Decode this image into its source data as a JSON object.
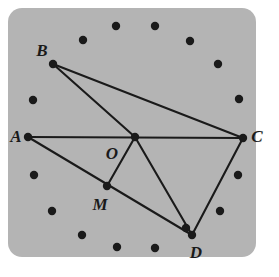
{
  "figure": {
    "kind": "geometry-diagram",
    "background_color": "#b4b4b4",
    "page_color": "#ffffff",
    "stroke_color": "#1a1a1a",
    "board": {
      "x": 8,
      "y": 8,
      "width": 248,
      "height": 249,
      "corner_radius": 14
    },
    "vertices": [
      {
        "id": "A",
        "label": "A",
        "x": 28,
        "y": 137,
        "label_x": 16,
        "label_y": 136
      },
      {
        "id": "B",
        "label": "B",
        "x": 53,
        "y": 64,
        "label_x": 42,
        "label_y": 50
      },
      {
        "id": "C",
        "label": "C",
        "x": 243,
        "y": 138,
        "label_x": 257,
        "label_y": 136
      },
      {
        "id": "D",
        "label": "D",
        "x": 192,
        "y": 235,
        "label_x": 196,
        "label_y": 252
      },
      {
        "id": "M",
        "label": "M",
        "x": 107,
        "y": 186,
        "label_x": 100,
        "label_y": 204
      },
      {
        "id": "O",
        "label": "O",
        "x": 135,
        "y": 137,
        "label_x": 112,
        "label_y": 153
      }
    ],
    "segments": [
      {
        "name": "segment-AC",
        "from": "A",
        "to": "C"
      },
      {
        "name": "segment-AD",
        "from": "A",
        "to": "D"
      },
      {
        "name": "segment-BO",
        "from": "B",
        "to": "O"
      },
      {
        "name": "segment-BC",
        "from": "B",
        "to": "C"
      },
      {
        "name": "segment-OM",
        "from": "O",
        "to": "M"
      },
      {
        "name": "segment-OD",
        "from": "O",
        "to": "D"
      },
      {
        "name": "segment-CD",
        "from": "C",
        "to": "D"
      }
    ],
    "ring_dots": [
      {
        "x": 83,
        "y": 40
      },
      {
        "x": 116,
        "y": 26
      },
      {
        "x": 155,
        "y": 26
      },
      {
        "x": 190,
        "y": 41
      },
      {
        "x": 218,
        "y": 64
      },
      {
        "x": 239,
        "y": 99
      },
      {
        "x": 238,
        "y": 175
      },
      {
        "x": 220,
        "y": 211
      },
      {
        "x": 186,
        "y": 228
      },
      {
        "x": 155,
        "y": 248
      },
      {
        "x": 117,
        "y": 247
      },
      {
        "x": 82,
        "y": 235
      },
      {
        "x": 52,
        "y": 211
      },
      {
        "x": 34,
        "y": 175
      },
      {
        "x": 33,
        "y": 100
      }
    ],
    "dot_radius": 4.2,
    "line_width": 2.1
  }
}
